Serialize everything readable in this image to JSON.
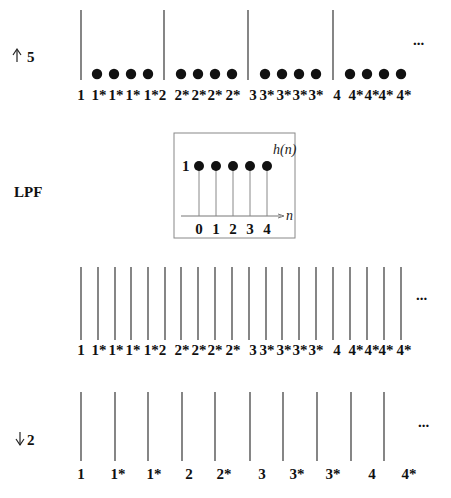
{
  "rows": {
    "upsample": {
      "label": "5",
      "arrow": "up",
      "ellipsis": "...",
      "lines_x": [
        81,
        164,
        248,
        333
      ],
      "line_top": 10,
      "line_bottom": 80,
      "dots_x": [
        97,
        114,
        131,
        148,
        181,
        198,
        215,
        232,
        265,
        282,
        299,
        316,
        350,
        367,
        384,
        401
      ],
      "dot_y": 74,
      "labels": [
        {
          "x": 81,
          "t": "1"
        },
        {
          "x": 99,
          "t": "1*"
        },
        {
          "x": 116,
          "t": "1*"
        },
        {
          "x": 133,
          "t": "1*"
        },
        {
          "x": 155,
          "t": "1*2"
        },
        {
          "x": 182,
          "t": "2*"
        },
        {
          "x": 199,
          "t": "2*"
        },
        {
          "x": 215,
          "t": "2*"
        },
        {
          "x": 233,
          "t": "2*"
        },
        {
          "x": 253,
          "t": "3"
        },
        {
          "x": 267,
          "t": "3*"
        },
        {
          "x": 284,
          "t": "3*"
        },
        {
          "x": 300,
          "t": "3*"
        },
        {
          "x": 316,
          "t": "3*"
        },
        {
          "x": 337,
          "t": "4"
        },
        {
          "x": 356,
          "t": "4*"
        },
        {
          "x": 372,
          "t": "4*"
        },
        {
          "x": 386,
          "t": "4*"
        },
        {
          "x": 404,
          "t": "4*"
        }
      ],
      "label_y": 100
    },
    "lpf": {
      "label": "LPF",
      "inset": {
        "title": "h(n)",
        "amplitude_label": "1",
        "axis_label": "n",
        "ticks": [
          "0",
          "1",
          "2",
          "3",
          "4"
        ],
        "values": [
          1,
          1,
          1,
          1,
          1
        ]
      }
    },
    "filtered": {
      "ellipsis": "...",
      "lines_x": [
        81,
        98,
        115,
        131,
        148,
        165,
        181,
        198,
        215,
        232,
        249,
        266,
        282,
        299,
        316,
        333,
        350,
        367,
        384,
        401
      ],
      "line_top": 267,
      "line_bottom": 340,
      "labels": [
        {
          "x": 81,
          "t": "1"
        },
        {
          "x": 99,
          "t": "1*"
        },
        {
          "x": 116,
          "t": "1*"
        },
        {
          "x": 133,
          "t": "1*"
        },
        {
          "x": 155,
          "t": "1*2"
        },
        {
          "x": 182,
          "t": "2*"
        },
        {
          "x": 199,
          "t": "2*"
        },
        {
          "x": 215,
          "t": "2*"
        },
        {
          "x": 233,
          "t": "2*"
        },
        {
          "x": 253,
          "t": "3"
        },
        {
          "x": 267,
          "t": "3*"
        },
        {
          "x": 284,
          "t": "3*"
        },
        {
          "x": 300,
          "t": "3*"
        },
        {
          "x": 316,
          "t": "3*"
        },
        {
          "x": 337,
          "t": "4"
        },
        {
          "x": 356,
          "t": "4*"
        },
        {
          "x": 372,
          "t": "4*"
        },
        {
          "x": 386,
          "t": "4*"
        },
        {
          "x": 404,
          "t": "4*"
        }
      ],
      "label_y": 355
    },
    "downsample": {
      "label": "2",
      "arrow": "down",
      "ellipsis": "...",
      "lines_x": [
        81,
        115,
        148,
        182,
        215,
        250,
        283,
        317,
        351,
        384
      ],
      "line_top": 392,
      "line_bottom": 461,
      "labels": [
        {
          "x": 81,
          "t": "1"
        },
        {
          "x": 118,
          "t": "1*"
        },
        {
          "x": 154,
          "t": "1*"
        },
        {
          "x": 189,
          "t": "2"
        },
        {
          "x": 224,
          "t": "2*"
        },
        {
          "x": 262,
          "t": "3"
        },
        {
          "x": 297,
          "t": "3*"
        },
        {
          "x": 333,
          "t": "3*"
        },
        {
          "x": 372,
          "t": "4"
        },
        {
          "x": 409,
          "t": "4*"
        }
      ],
      "label_y": 479
    }
  }
}
